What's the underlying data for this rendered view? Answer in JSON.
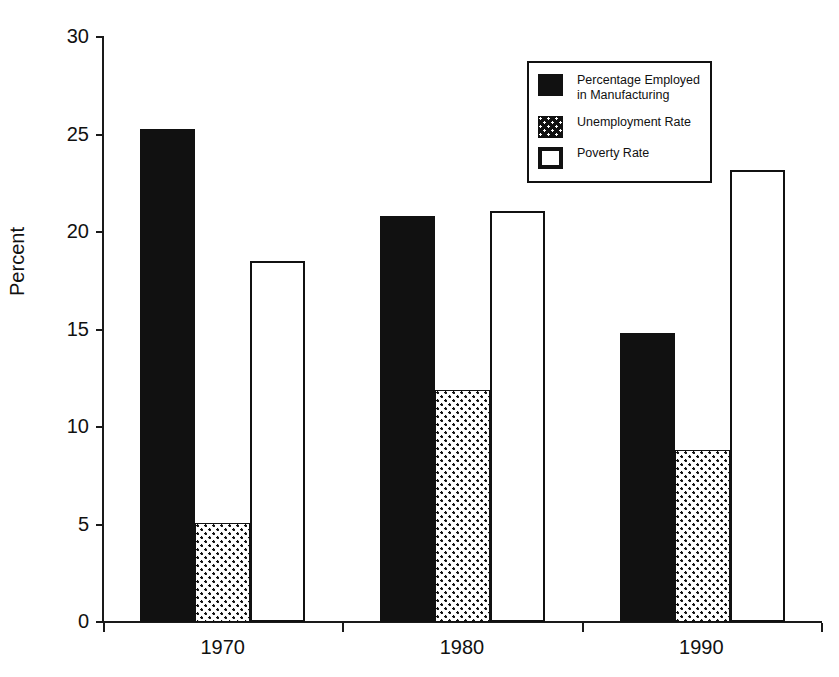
{
  "chart_data": {
    "type": "bar",
    "title": "",
    "subtitle": "",
    "xlabel": "",
    "ylabel": "Percent",
    "categories": [
      "1970",
      "1980",
      "1990"
    ],
    "ylim": [
      0,
      30
    ],
    "yticks": [
      0,
      5,
      10,
      15,
      20,
      25,
      30
    ],
    "ytick_labels": [
      "0",
      "5",
      "10",
      "15",
      "20",
      "25",
      "30"
    ],
    "grid": false,
    "legend_position": "top-right",
    "series": [
      {
        "name": "Percentage Employed in Manufacturing",
        "legend_label": "Percentage Employed\nin Manufacturing",
        "pattern": "solid-black",
        "values": [
          25.3,
          20.8,
          14.8
        ]
      },
      {
        "name": "Unemployment Rate",
        "legend_label": "Unemployment Rate",
        "pattern": "checkered-gray",
        "values": [
          5.1,
          11.9,
          8.8
        ]
      },
      {
        "name": "Poverty Rate",
        "legend_label": "Poverty Rate",
        "pattern": "hollow-white",
        "values": [
          18.5,
          21.1,
          23.2
        ]
      }
    ]
  },
  "axes": {
    "y_title": "Percent",
    "y_tick_labels": [
      "30",
      "25",
      "20",
      "15",
      "10",
      "5",
      "0"
    ],
    "x_tick_labels": [
      "1970",
      "1980",
      "1990"
    ]
  },
  "legend": {
    "items": [
      {
        "swatch": "solid-black-swatch",
        "label": "Percentage Employed\nin Manufacturing"
      },
      {
        "swatch": "checkered-swatch",
        "label": "Unemployment Rate"
      },
      {
        "swatch": "hollow-swatch",
        "label": "Poverty Rate"
      }
    ]
  },
  "colors": {
    "ink": "#111111",
    "background": "#ffffff"
  }
}
